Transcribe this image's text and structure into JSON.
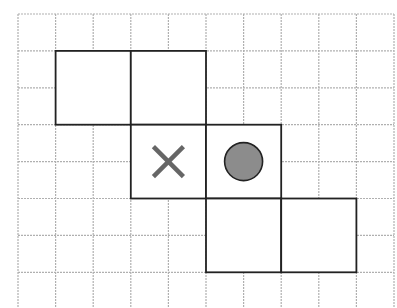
{
  "diagram": {
    "title": "",
    "grid": {
      "origin_x": 18,
      "origin_y": 14,
      "cols": 10,
      "rows": 8,
      "cell_w": 37.6,
      "cell_h": 36.9,
      "line_color": "#b0b0b0",
      "extends_to_bottom": true
    },
    "squares": [
      {
        "col": 1,
        "row": 1,
        "size": 2,
        "content": ""
      },
      {
        "col": 3,
        "row": 1,
        "size": 2,
        "content": ""
      },
      {
        "col": 3,
        "row": 3,
        "size": 2,
        "content": "cross"
      },
      {
        "col": 5,
        "row": 3,
        "size": 2,
        "content": "circle"
      },
      {
        "col": 5,
        "row": 5,
        "size": 2,
        "content": ""
      },
      {
        "col": 7,
        "row": 5,
        "size": 2,
        "content": ""
      }
    ],
    "square_border_color": "#222222",
    "cross_color": "#666666",
    "circle_fill": "#8c8c8c",
    "circle_stroke": "#222222"
  }
}
